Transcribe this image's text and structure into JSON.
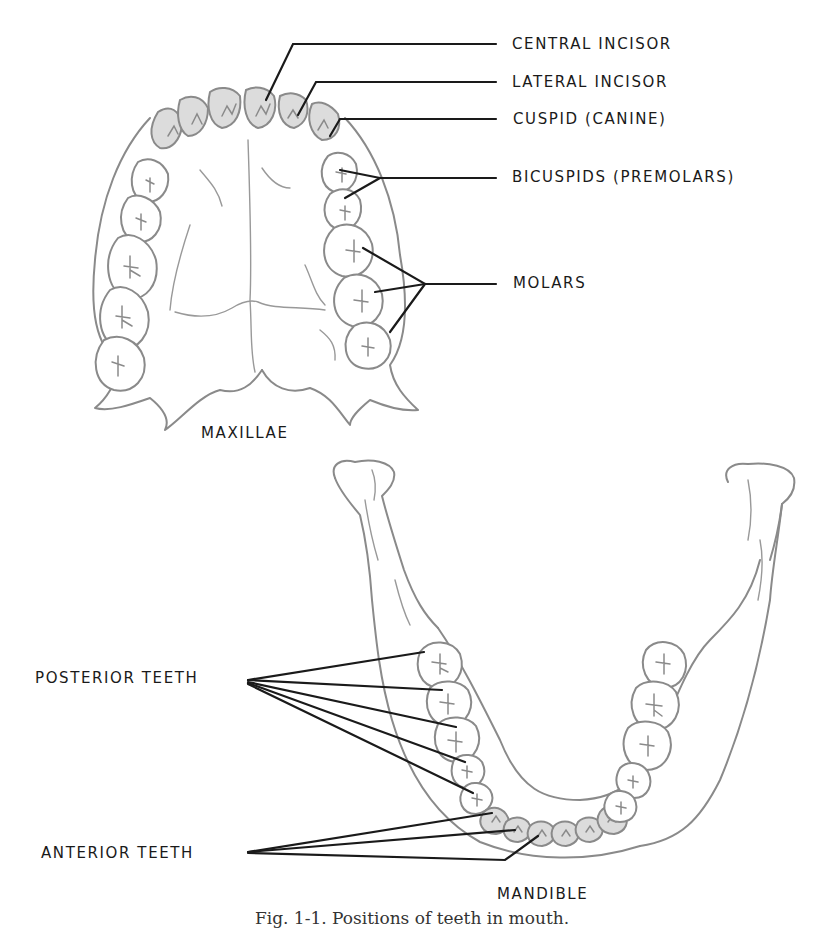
{
  "figure": {
    "upper": {
      "title": "MAXILLAE",
      "labels": {
        "central_incisor": "CENTRAL INCISOR",
        "lateral_incisor": "LATERAL INCISOR",
        "cuspid": "CUSPID (CANINE)",
        "bicuspids": "BICUSPIDS (PREMOLARS)",
        "molars": "MOLARS"
      }
    },
    "lower": {
      "title": "MANDIBLE",
      "labels": {
        "posterior": "POSTERIOR TEETH",
        "anterior": "ANTERIOR TEETH"
      }
    },
    "caption": "Fig. 1-1. Positions of teeth in mouth."
  },
  "colors": {
    "drawing_stroke": "#8a8a8a",
    "anterior_tooth_fill": "#dcdcdc",
    "leader_line": "#1a1a1a",
    "background": "#ffffff"
  }
}
